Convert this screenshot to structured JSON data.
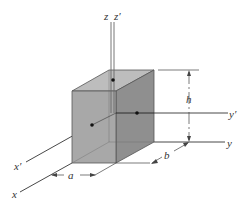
{
  "diagram": {
    "type": "3d-rectangular-block-with-axes",
    "labels": {
      "z": "z",
      "z_prime": "z′",
      "y": "y",
      "y_prime": "y′",
      "x": "x",
      "x_prime": "x′",
      "h": "h",
      "a": "a",
      "b": "b"
    },
    "colors": {
      "front_face": "#a6a6a6",
      "right_face": "#8c8c8c",
      "top_face": "#bdbdbd",
      "edge": "#555555",
      "axis": "#333333",
      "dot": "#111111",
      "background": "#ffffff"
    }
  }
}
